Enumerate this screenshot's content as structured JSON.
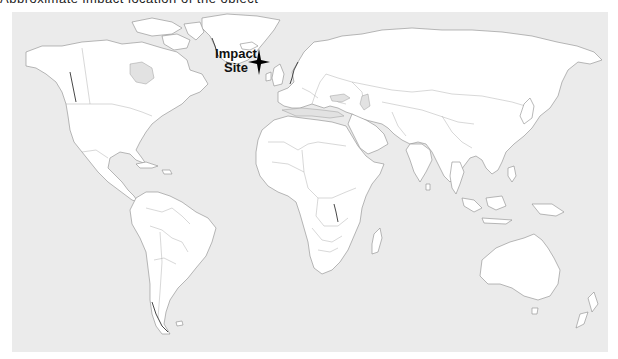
{
  "caption_cropped": "Approximate impact location of the object",
  "map": {
    "projection": "equirectangular world political outline map",
    "ocean_color": "#ebebeb",
    "land_color": "#ffffff",
    "border_color": "#8a8a8a"
  },
  "annotation": {
    "label_line1": "Impact",
    "label_line2": "Site",
    "marker_icon": "four-point-star-icon",
    "marker_color": "#000000"
  }
}
